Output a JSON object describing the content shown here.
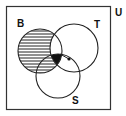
{
  "diagram": {
    "type": "venn",
    "universe_label": "U",
    "sets": [
      {
        "name": "B",
        "label": "B",
        "cx": 40,
        "cy": 51,
        "r": 22
      },
      {
        "name": "T",
        "label": "T",
        "cx": 74,
        "cy": 48,
        "r": 24
      },
      {
        "name": "S",
        "label": "S",
        "cx": 58,
        "cy": 76,
        "r": 22
      }
    ],
    "shaded_region": "B minus T (hatched)",
    "filled_region": "B ∩ T ∩ S (solid black)",
    "marked_point": {
      "description": "dot in T ∩ S",
      "x": 69,
      "y": 59
    },
    "colors": {
      "stroke": "#222222",
      "fill": "#111111",
      "background": "#ffffff"
    }
  }
}
